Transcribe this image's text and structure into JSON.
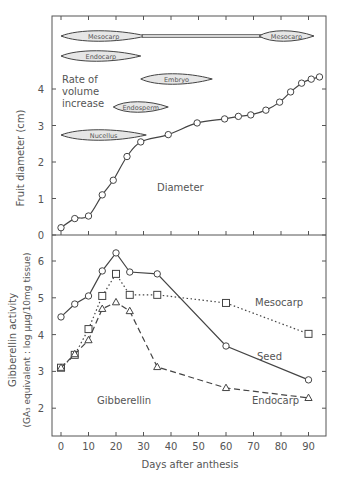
{
  "chart_data": [
    {
      "type": "line",
      "title": "",
      "xlabel": "Days after anthesis",
      "ylabel": "Fruit diameter (cm)",
      "xlim": [
        -3,
        96
      ],
      "ylim": [
        0,
        5.4
      ],
      "yticks": [
        0,
        1,
        2,
        3,
        4
      ],
      "grid": false,
      "annotations": [
        "Diameter",
        "Rate of volume increase"
      ],
      "series": [
        {
          "name": "Diameter",
          "marker": "circle",
          "line": "solid-smooth",
          "x": [
            0,
            5,
            10,
            15,
            19,
            24,
            29,
            39,
            49.5,
            59.5,
            64.5,
            69,
            74.5,
            79.5,
            83.5,
            87.5,
            91,
            94
          ],
          "values": [
            0.2,
            0.45,
            0.52,
            1.1,
            1.5,
            2.15,
            2.55,
            2.75,
            3.07,
            3.18,
            3.25,
            3.29,
            3.42,
            3.64,
            3.92,
            4.16,
            4.27,
            4.33
          ]
        }
      ],
      "volume_increase_bands": [
        {
          "label": "Mesocarp",
          "segments": [
            {
              "from": 0,
              "to": 31,
              "style": "thick"
            },
            {
              "from": 31,
              "to": 72,
              "style": "thin"
            },
            {
              "from": 72,
              "to": 92,
              "style": "thick"
            }
          ],
          "label2": "Mesocarp",
          "y": 36
        },
        {
          "label": "Endocarp",
          "segments": [
            {
              "from": 0,
              "to": 29,
              "style": "thick"
            }
          ],
          "y": 56
        },
        {
          "label": "Embryo",
          "segments": [
            {
              "from": 29,
              "to": 55,
              "style": "thick"
            }
          ],
          "y": 79
        },
        {
          "label": "Endosperm",
          "segments": [
            {
              "from": 19,
              "to": 39,
              "style": "thick"
            }
          ],
          "y": 107
        },
        {
          "label": "Nucellus",
          "segments": [
            {
              "from": 0,
              "to": 31,
              "style": "thick"
            }
          ],
          "y": 135
        }
      ]
    },
    {
      "type": "line",
      "title": "",
      "xlabel": "Days after anthesis",
      "ylabel": "Gibberellin activity (GA3 equivalent : log µµg/10 mg tissue)",
      "xlim": [
        -3,
        96
      ],
      "ylim": [
        1.25,
        6.7
      ],
      "yticks": [
        2,
        3,
        4,
        5,
        6
      ],
      "xticks": [
        0,
        10,
        20,
        30,
        40,
        50,
        60,
        70,
        80,
        90
      ],
      "grid": false,
      "annotations": [
        "Gibberellin"
      ],
      "categories": [
        0,
        5,
        10,
        15,
        20,
        25,
        35,
        60,
        90
      ],
      "series": [
        {
          "name": "Seed",
          "marker": "circle",
          "line": "solid",
          "values": [
            4.48,
            4.83,
            5.05,
            5.73,
            6.22,
            5.7,
            5.65,
            3.69,
            2.77
          ]
        },
        {
          "name": "Mesocarp",
          "marker": "square",
          "line": "dotted",
          "values": [
            3.1,
            3.45,
            4.15,
            5.05,
            5.65,
            5.08,
            5.08,
            4.86,
            4.02
          ]
        },
        {
          "name": "Endocarp",
          "marker": "triangle",
          "line": "dashed",
          "values": [
            3.1,
            3.47,
            3.85,
            4.7,
            4.88,
            4.64,
            3.12,
            2.55,
            2.28
          ]
        }
      ]
    }
  ],
  "labels": {
    "upper_ylabel": "Fruit diameter  (cm)",
    "lower_ylabel_1": "Gibberellin  activity",
    "lower_ylabel_2": "(GA₃ equivalent : log µµg/10mg  tissue)",
    "xlabel": "Days  after  anthesis",
    "diameter": "Diameter",
    "rate_1": "Rate  of",
    "rate_2": "volume",
    "rate_3": "increase",
    "gibberellin": "Gibberellin",
    "seed": "Seed",
    "mesocarp": "Mesocarp",
    "endocarp": "Endocarp",
    "band_mesocarp": "Mesocarp",
    "band_mesocarp2": "Mesocarp",
    "band_endocarp": "Endocarp",
    "band_embryo": "Embryo",
    "band_endosperm": "Endosperm",
    "band_nucellus": "Nucellus"
  },
  "colors": {
    "ink": "#444444",
    "band_fill": "#e6e6e6",
    "text": "#555555"
  }
}
